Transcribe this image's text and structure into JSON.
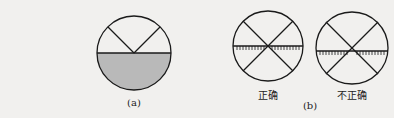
{
  "figure_a": {
    "label": "(a)",
    "shade_color": "#b9b9b9"
  },
  "figure_b": {
    "label": "(b)",
    "left": {
      "caption": "正确"
    },
    "right": {
      "caption": "不正确"
    }
  },
  "colors": {
    "stroke": "#1a1a1a",
    "background": "#f1f0ee"
  }
}
